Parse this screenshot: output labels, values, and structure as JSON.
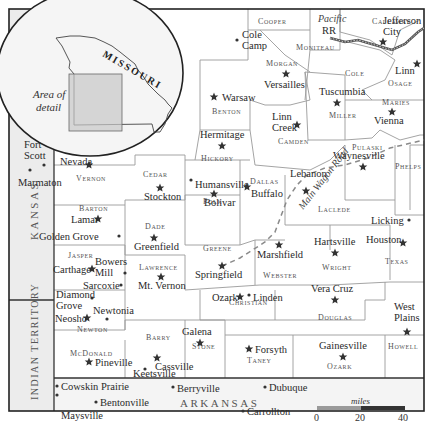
{
  "map": {
    "title": "Southwest Missouri area map",
    "inset": {
      "state_label": "MISSOURI",
      "caption_line1": "Area of",
      "caption_line2": "detail"
    },
    "regions": {
      "kansas": "KANSAS",
      "indian_territory": "INDIAN TERRITORY",
      "arkansas": "ARKANSAS"
    },
    "routes": {
      "railroad_line1": "Pacific",
      "railroad_line2": "RR",
      "wagon_road": "Main Wagon Road"
    },
    "counties": [
      {
        "name": "Cooper"
      },
      {
        "name": "Moniteau"
      },
      {
        "name": "Callaway"
      },
      {
        "name": "Cole"
      },
      {
        "name": "Osage"
      },
      {
        "name": "Morgan"
      },
      {
        "name": "Benton"
      },
      {
        "name": "Miller"
      },
      {
        "name": "Maries"
      },
      {
        "name": "Camden"
      },
      {
        "name": "Hickory"
      },
      {
        "name": "Pulaski"
      },
      {
        "name": "Phelps"
      },
      {
        "name": "Vernon"
      },
      {
        "name": "Cedar"
      },
      {
        "name": "Polk"
      },
      {
        "name": "Dallas"
      },
      {
        "name": "Laclede"
      },
      {
        "name": "Barton"
      },
      {
        "name": "Dade"
      },
      {
        "name": "Greene"
      },
      {
        "name": "Webster"
      },
      {
        "name": "Wright"
      },
      {
        "name": "Texas"
      },
      {
        "name": "Jasper"
      },
      {
        "name": "Lawrence"
      },
      {
        "name": "Christian"
      },
      {
        "name": "Douglas"
      },
      {
        "name": "Newton"
      },
      {
        "name": "Barry"
      },
      {
        "name": "Stone"
      },
      {
        "name": "Taney"
      },
      {
        "name": "Ozark"
      },
      {
        "name": "Howell"
      },
      {
        "name": "McDonald"
      }
    ],
    "towns": [
      {
        "name": "Cole Camp",
        "type": "town"
      },
      {
        "name": "Jefferson City",
        "type": "seat"
      },
      {
        "name": "Linn",
        "type": "seat"
      },
      {
        "name": "Versailles",
        "type": "seat"
      },
      {
        "name": "Warsaw",
        "type": "seat"
      },
      {
        "name": "Tuscumbia",
        "type": "seat"
      },
      {
        "name": "Vienna",
        "type": "seat"
      },
      {
        "name": "Linn Creek",
        "type": "seat"
      },
      {
        "name": "Hermitage",
        "type": "seat"
      },
      {
        "name": "Waynesville",
        "type": "seat"
      },
      {
        "name": "Fort Scott",
        "type": "town"
      },
      {
        "name": "Marmaton",
        "type": "town"
      },
      {
        "name": "Nevada",
        "type": "seat"
      },
      {
        "name": "Stockton",
        "type": "seat"
      },
      {
        "name": "Humansville",
        "type": "town"
      },
      {
        "name": "Bolivar",
        "type": "seat"
      },
      {
        "name": "Buffalo",
        "type": "seat"
      },
      {
        "name": "Lebanon",
        "type": "seat"
      },
      {
        "name": "Lamar",
        "type": "seat"
      },
      {
        "name": "Golden Grove",
        "type": "town"
      },
      {
        "name": "Greenfield",
        "type": "seat"
      },
      {
        "name": "Licking",
        "type": "town"
      },
      {
        "name": "Houston",
        "type": "seat"
      },
      {
        "name": "Marshfield",
        "type": "seat"
      },
      {
        "name": "Hartsville",
        "type": "seat"
      },
      {
        "name": "Carthage",
        "type": "seat"
      },
      {
        "name": "Bowers Mill",
        "type": "town"
      },
      {
        "name": "Sarcoxie",
        "type": "town"
      },
      {
        "name": "Mt. Vernon",
        "type": "seat"
      },
      {
        "name": "Springfield",
        "type": "seat"
      },
      {
        "name": "Diamond Grove",
        "type": "town"
      },
      {
        "name": "Neosho",
        "type": "seat"
      },
      {
        "name": "Newtonia",
        "type": "town"
      },
      {
        "name": "Ozark",
        "type": "seat"
      },
      {
        "name": "Linden",
        "type": "town"
      },
      {
        "name": "Vera Cruz",
        "type": "seat"
      },
      {
        "name": "West Plains",
        "type": "seat"
      },
      {
        "name": "Galena",
        "type": "seat"
      },
      {
        "name": "Cassville",
        "type": "seat"
      },
      {
        "name": "Keetsville",
        "type": "town"
      },
      {
        "name": "Forsyth",
        "type": "seat"
      },
      {
        "name": "Gainesville",
        "type": "seat"
      },
      {
        "name": "Pineville",
        "type": "seat"
      },
      {
        "name": "Cowskin Prairie",
        "type": "town"
      },
      {
        "name": "Maysville",
        "type": "town"
      },
      {
        "name": "Bentonville",
        "type": "town"
      },
      {
        "name": "Berryville",
        "type": "town"
      },
      {
        "name": "Dubuque",
        "type": "town"
      },
      {
        "name": "Carrollton",
        "type": "town"
      }
    ],
    "scale": {
      "unit": "miles",
      "ticks": [
        "0",
        "20",
        "40"
      ]
    },
    "icons": {
      "county_seat": "star-icon",
      "town": "dot-icon"
    }
  }
}
